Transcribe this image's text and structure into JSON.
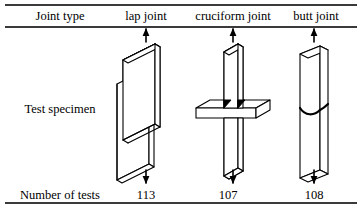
{
  "table": {
    "row_labels": {
      "joint_type": "Joint type",
      "test_specimen": "Test specimen",
      "number_of_tests": "Number of tests"
    },
    "columns": [
      {
        "id": "lap",
        "header": "lap joint",
        "number_of_tests": "113",
        "specimen_icon": "lap-joint-specimen-icon"
      },
      {
        "id": "cruciform",
        "header": "cruciform joint",
        "number_of_tests": "107",
        "specimen_icon": "cruciform-joint-specimen-icon"
      },
      {
        "id": "butt",
        "header": "butt joint",
        "number_of_tests": "108",
        "specimen_icon": "butt-joint-specimen-icon"
      }
    ]
  },
  "style": {
    "line_color": "#000000",
    "rule_color": "#3a3a3a",
    "background": "#ffffff",
    "weld_color": "#000000"
  }
}
